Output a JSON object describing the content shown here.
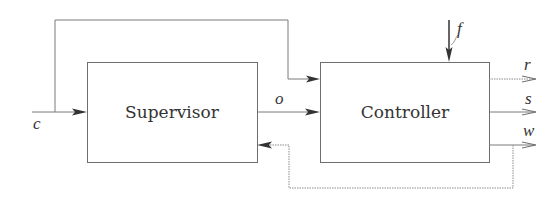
{
  "diagram": {
    "type": "block-diagram",
    "blocks": [
      {
        "id": "supervisor",
        "label": "Supervisor"
      },
      {
        "id": "controller",
        "label": "Controller"
      }
    ],
    "signals": {
      "c": "c",
      "o": "o",
      "f": "f",
      "r": "r",
      "s": "s",
      "w": "w"
    },
    "edges": [
      {
        "from": "external",
        "to": "supervisor",
        "signal": "c"
      },
      {
        "from": "external",
        "to": "controller",
        "signal": "c",
        "note": "branch of c routed over the top"
      },
      {
        "from": "supervisor",
        "to": "controller",
        "signal": "o"
      },
      {
        "from": "external",
        "to": "controller",
        "signal": "f"
      },
      {
        "from": "controller",
        "to": "external",
        "signal": "r",
        "style": "dotted"
      },
      {
        "from": "controller",
        "to": "external",
        "signal": "s"
      },
      {
        "from": "controller",
        "to": "external",
        "signal": "w"
      },
      {
        "from": "controller",
        "to": "supervisor",
        "signal": "w",
        "note": "feedback loop, dotted"
      }
    ]
  },
  "colors": {
    "line": "#7a7a7a",
    "box_border": "#6e6e6e",
    "text": "#333333",
    "background": "#ffffff"
  }
}
